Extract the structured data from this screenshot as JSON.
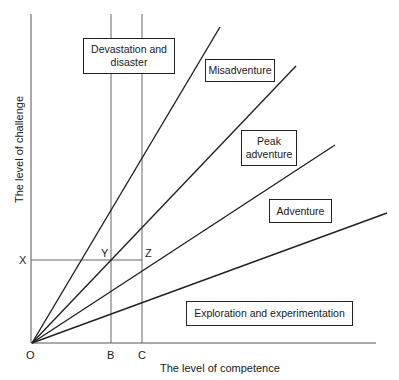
{
  "diagram": {
    "axes": {
      "x_label": "The level of competence",
      "y_label": "The level of challenge"
    },
    "points": {
      "origin": "O",
      "x_marker": "X",
      "b_marker": "B",
      "c_marker": "C",
      "y_point": "Y",
      "z_point": "Z"
    },
    "regions": [
      {
        "label_line1": "Devastation and",
        "label_line2": "disaster"
      },
      {
        "label": "Misadventure"
      },
      {
        "label_line1": "Peak",
        "label_line2": "adventure"
      },
      {
        "label": "Adventure"
      },
      {
        "label": "Exploration and experimentation"
      }
    ],
    "line_color": "#222222",
    "guide_color": "#666666"
  }
}
